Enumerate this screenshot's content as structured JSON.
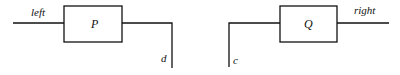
{
  "diagram": {
    "left_process": {
      "box_label": "P",
      "input_label": "left",
      "output_label": "d"
    },
    "right_process": {
      "box_label": "Q",
      "input_label": "c",
      "output_label": "right"
    }
  }
}
